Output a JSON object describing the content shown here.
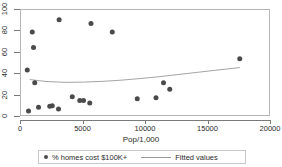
{
  "chart_data": {
    "type": "scatter",
    "title": "",
    "xlabel": "Pop/1,000",
    "ylabel": "",
    "xlim": [
      0,
      20000
    ],
    "ylim": [
      0,
      100
    ],
    "grid": false,
    "legend_position": "bottom",
    "xticks": [
      "0",
      "5000",
      "10000",
      "15000",
      "20000"
    ],
    "xtick_values": [
      0,
      5000,
      10000,
      15000,
      20000
    ],
    "yticks": [
      "0",
      "20",
      "40",
      "60",
      "80",
      "100"
    ],
    "ytick_values": [
      0,
      20,
      40,
      60,
      80,
      100
    ],
    "series": [
      {
        "name": "% homes cost $100K+",
        "type": "scatter",
        "color": "#4a4a4a",
        "marker": "circle",
        "points": [
          [
            500,
            44
          ],
          [
            600,
            5.5
          ],
          [
            900,
            79.5
          ],
          [
            1000,
            65
          ],
          [
            1100,
            32
          ],
          [
            1400,
            9
          ],
          [
            2300,
            10
          ],
          [
            2500,
            10.5
          ],
          [
            3000,
            7.5
          ],
          [
            3050,
            91
          ],
          [
            4100,
            19
          ],
          [
            4700,
            15.5
          ],
          [
            5000,
            15.5
          ],
          [
            5500,
            13
          ],
          [
            5600,
            87.5
          ],
          [
            7300,
            79.5
          ],
          [
            9300,
            17
          ],
          [
            10800,
            18
          ],
          [
            11400,
            32
          ],
          [
            11900,
            26
          ],
          [
            17500,
            54.5
          ]
        ]
      },
      {
        "name": "Fitted values",
        "type": "line",
        "color": "#9a9a9a",
        "points": [
          [
            700,
            35.0
          ],
          [
            2000,
            33.2
          ],
          [
            3500,
            32.4
          ],
          [
            5000,
            32.6
          ],
          [
            6500,
            33.3
          ],
          [
            8000,
            34.4
          ],
          [
            9500,
            35.9
          ],
          [
            11000,
            37.6
          ],
          [
            12500,
            39.6
          ],
          [
            14000,
            41.6
          ],
          [
            15500,
            43.6
          ],
          [
            17500,
            46.2
          ]
        ]
      }
    ],
    "legend": [
      {
        "label": "% homes cost $100K+",
        "marker": "circle",
        "color": "#4a4a4a"
      },
      {
        "label": "Fitted values",
        "marker": "line",
        "color": "#9a9a9a"
      }
    ]
  }
}
